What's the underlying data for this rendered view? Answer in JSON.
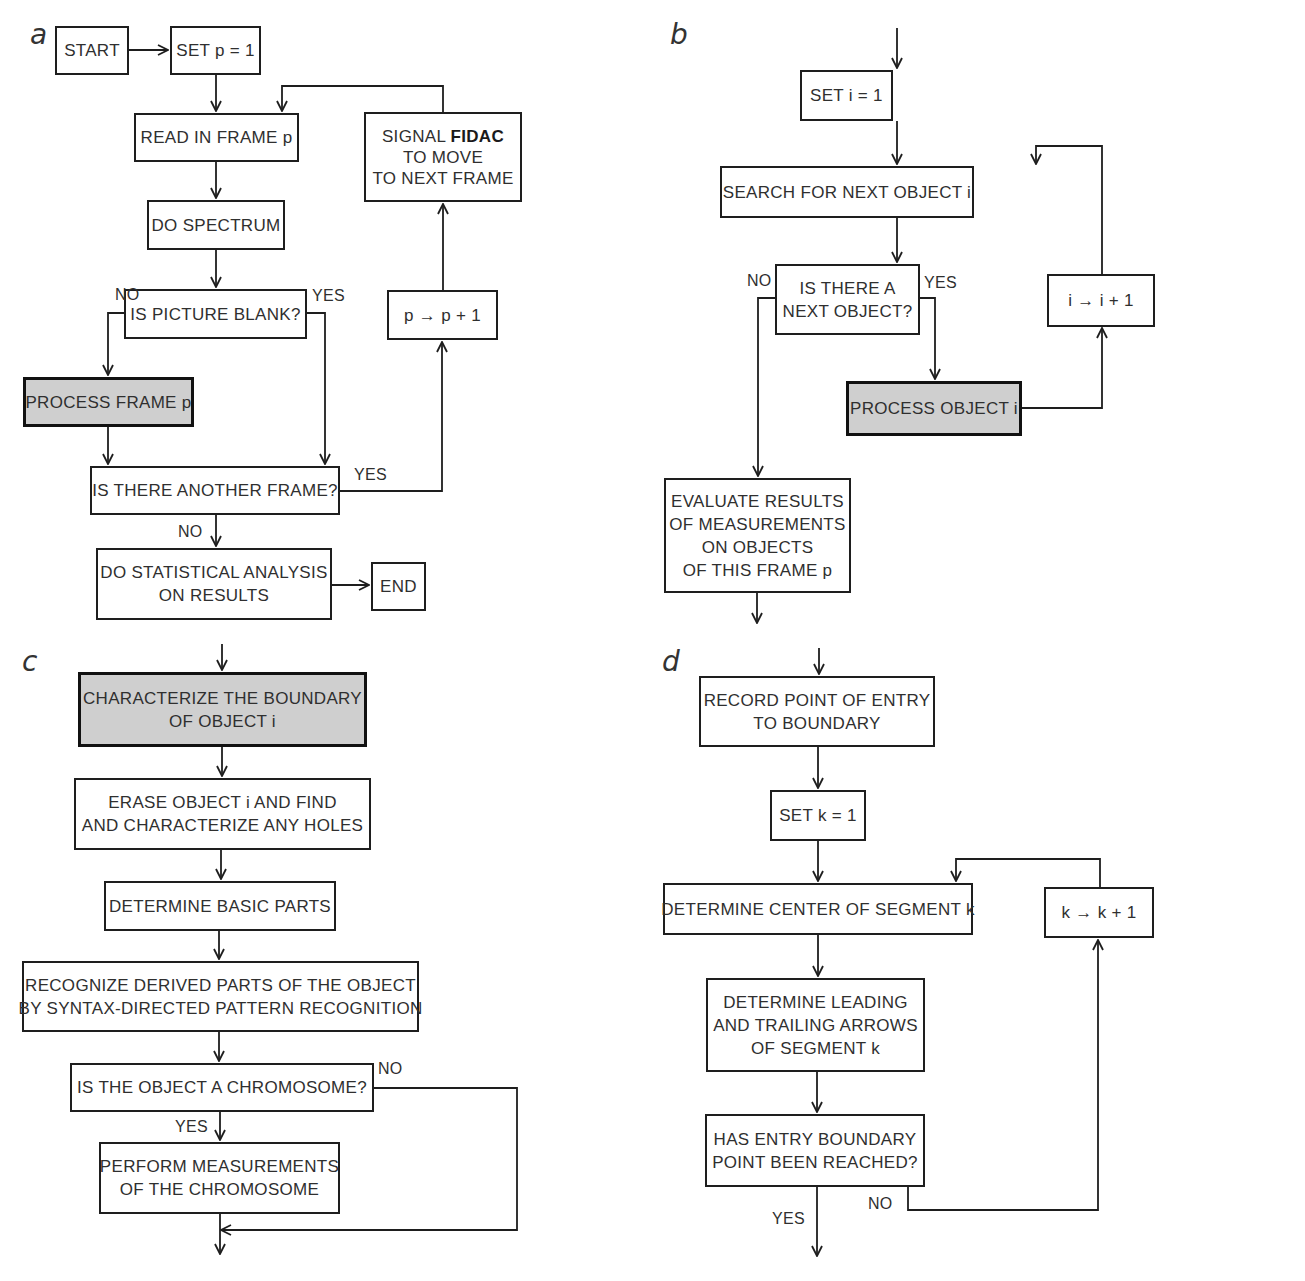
{
  "panels": {
    "a": {
      "label": "a",
      "start": "START",
      "set_p": "SET p = 1",
      "read_frame": "READ IN FRAME p",
      "signal_line1_pre": "SIGNAL ",
      "signal_line1_bold": "FIDAC",
      "signal_line2": "TO MOVE",
      "signal_line3": "TO NEXT FRAME",
      "do_spectrum": "DO SPECTRUM",
      "picture_blank": "IS PICTURE BLANK?",
      "increment_p": "p → p + 1",
      "process_frame": "PROCESS FRAME p",
      "another_frame": "IS THERE ANOTHER FRAME?",
      "stats_line1": "DO STATISTICAL ANALYSIS",
      "stats_line2": "ON RESULTS",
      "end": "END",
      "no_blank": "NO",
      "yes_blank": "YES",
      "yes_another": "YES",
      "no_another": "NO"
    },
    "b": {
      "label": "b",
      "set_i": "SET i = 1",
      "search": "SEARCH FOR NEXT OBJECT i",
      "next_object_line1": "IS THERE A",
      "next_object_line2": "NEXT OBJECT?",
      "increment_i": "i → i + 1",
      "process_object": "PROCESS OBJECT i",
      "evaluate_line1": "EVALUATE RESULTS",
      "evaluate_line2": "OF MEASUREMENTS",
      "evaluate_line3": "ON OBJECTS",
      "evaluate_line4": "OF THIS FRAME p",
      "no": "NO",
      "yes": "YES"
    },
    "c": {
      "label": "c",
      "characterize_line1": "CHARACTERIZE THE BOUNDARY",
      "characterize_line2": "OF OBJECT i",
      "erase_line1": "ERASE OBJECT i AND FIND",
      "erase_line2": "AND CHARACTERIZE ANY HOLES",
      "basic_parts": "DETERMINE BASIC PARTS",
      "recognize_line1": "RECOGNIZE DERIVED PARTS OF THE OBJECT",
      "recognize_line2": "BY SYNTAX-DIRECTED PATTERN RECOGNITION",
      "is_chromosome": "IS THE OBJECT A CHROMOSOME?",
      "measure_line1": "PERFORM MEASUREMENTS",
      "measure_line2": "OF THE CHROMOSOME",
      "no": "NO",
      "yes": "YES"
    },
    "d": {
      "label": "d",
      "record_line1": "RECORD POINT OF ENTRY",
      "record_line2": "TO BOUNDARY",
      "set_k": "SET k = 1",
      "center_segment": "DETERMINE CENTER OF SEGMENT k",
      "increment_k": "k → k + 1",
      "leading_line1": "DETERMINE LEADING",
      "leading_line2": "AND TRAILING ARROWS",
      "leading_line3": "OF SEGMENT k",
      "reached_line1": "HAS ENTRY BOUNDARY",
      "reached_line2": "POINT BEEN REACHED?",
      "no": "NO",
      "yes": "YES"
    }
  },
  "colors": {
    "stroke": "#1e1e1e",
    "shaded_fill": "#cfcfcf",
    "background": "#ffffff"
  }
}
